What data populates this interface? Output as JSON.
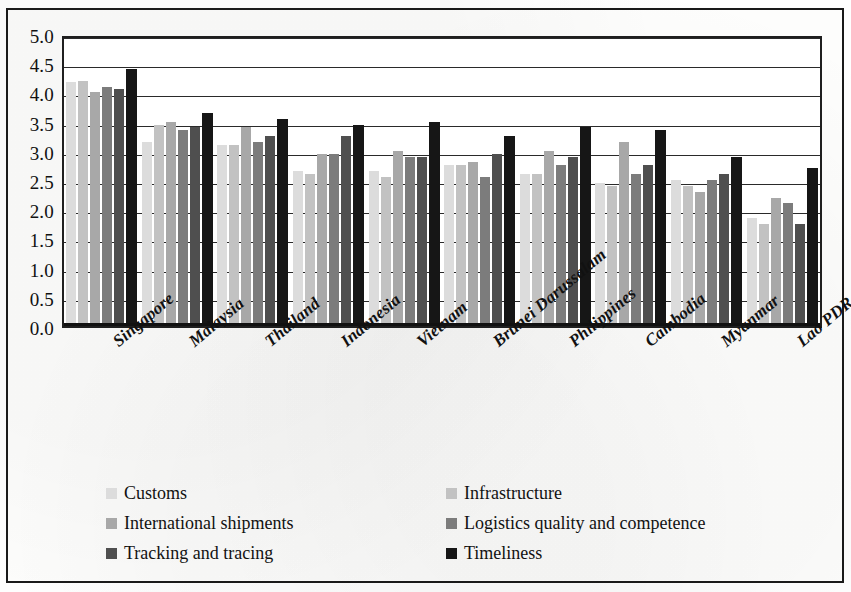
{
  "chart_data": {
    "type": "bar",
    "title": "",
    "subtitle": "",
    "xlabel": "",
    "ylabel": "",
    "ylim": [
      0.0,
      5.0
    ],
    "y_ticks": [
      "0.0",
      "0.5",
      "1.0",
      "1.5",
      "2.0",
      "2.5",
      "3.0",
      "3.5",
      "4.0",
      "4.5",
      "5.0"
    ],
    "y_tick_values": [
      0.0,
      0.5,
      1.0,
      1.5,
      2.0,
      2.5,
      3.0,
      3.5,
      4.0,
      4.5,
      5.0
    ],
    "grid": true,
    "grid_axis": "y",
    "legend_position": "bottom",
    "legend_columns": 2,
    "categories": [
      "Singapore",
      "Malaysia",
      "Thailand",
      "Indonesia",
      "Vietnam",
      "Brunei Darussalam",
      "Philippines",
      "Cambodia",
      "Myanmar",
      "Lao PDR"
    ],
    "series": [
      {
        "name": "Customs",
        "color": "#dcdcdc",
        "values": [
          4.18,
          3.15,
          3.1,
          2.65,
          2.65,
          2.75,
          2.6,
          2.45,
          2.5,
          1.85
        ]
      },
      {
        "name": "Infrastructure",
        "color": "#c2c2c2",
        "values": [
          4.2,
          3.45,
          3.1,
          2.6,
          2.55,
          2.75,
          2.6,
          2.4,
          2.4,
          1.75
        ]
      },
      {
        "name": "International shipments",
        "color": "#a8a8a8",
        "values": [
          4.0,
          3.5,
          3.4,
          2.95,
          3.0,
          2.8,
          3.0,
          3.15,
          2.3,
          2.2
        ]
      },
      {
        "name": "Logistics quality and competence",
        "color": "#7c7c7c",
        "values": [
          4.1,
          3.35,
          3.15,
          2.95,
          2.9,
          2.55,
          2.75,
          2.6,
          2.5,
          2.1
        ]
      },
      {
        "name": "Tracking and tracing",
        "color": "#4f4f4f",
        "values": [
          4.05,
          3.4,
          3.25,
          3.25,
          2.9,
          2.95,
          2.9,
          2.75,
          2.6,
          1.75
        ]
      },
      {
        "name": "Timeliness",
        "color": "#161616",
        "values": [
          4.4,
          3.65,
          3.55,
          3.45,
          3.5,
          3.25,
          3.4,
          3.35,
          2.9,
          2.7
        ]
      }
    ]
  },
  "legend": {
    "items": [
      {
        "label": "Customs",
        "swatch": "#dcdcdc"
      },
      {
        "label": "Infrastructure",
        "swatch": "#c2c2c2"
      },
      {
        "label": "International shipments",
        "swatch": "#a8a8a8"
      },
      {
        "label": "Logistics quality and competence",
        "swatch": "#7c7c7c"
      },
      {
        "label": "Tracking and tracing",
        "swatch": "#4f4f4f"
      },
      {
        "label": "Timeliness",
        "swatch": "#161616"
      }
    ],
    "order": [
      0,
      1,
      2,
      3,
      4,
      5
    ]
  }
}
